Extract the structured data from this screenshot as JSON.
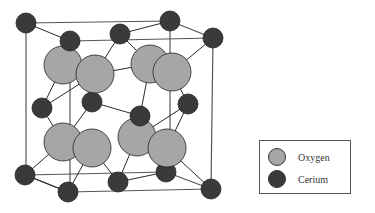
{
  "colors": {
    "oxygen": "#a6a6a6",
    "cerium": "#3a3a3a",
    "bond": "#2a2a2a",
    "frame": "#555555"
  },
  "legend": {
    "items": [
      {
        "label": "Oxygen",
        "color": "#a6a6a6"
      },
      {
        "label": "Cerium",
        "color": "#3a3a3a"
      }
    ]
  },
  "structure": {
    "cube_front": [
      [
        26,
        23
      ],
      [
        213,
        38
      ],
      [
        211,
        189
      ],
      [
        25,
        175
      ]
    ],
    "cube_edges": [
      [
        26,
        23,
        170,
        21
      ],
      [
        26,
        23,
        26,
        175
      ],
      [
        170,
        21,
        213,
        38
      ],
      [
        213,
        38,
        211,
        189
      ],
      [
        26,
        175,
        68,
        192
      ],
      [
        68,
        192,
        211,
        189
      ],
      [
        70,
        41,
        213,
        38
      ],
      [
        70,
        41,
        70,
        192
      ],
      [
        170,
        21,
        170,
        172
      ],
      [
        26,
        175,
        166,
        172
      ],
      [
        166,
        172,
        211,
        189
      ]
    ],
    "bonds": [
      [
        26,
        23,
        70,
        41
      ],
      [
        170,
        21,
        120,
        34
      ],
      [
        213,
        38,
        172,
        72
      ],
      [
        70,
        41,
        63,
        65
      ],
      [
        120,
        34,
        95,
        74
      ],
      [
        120,
        34,
        150,
        64
      ],
      [
        63,
        65,
        42,
        108
      ],
      [
        95,
        74,
        92,
        102
      ],
      [
        95,
        74,
        150,
        64
      ],
      [
        150,
        64,
        140,
        116
      ],
      [
        172,
        72,
        188,
        104
      ],
      [
        42,
        108,
        63,
        142
      ],
      [
        92,
        102,
        63,
        142
      ],
      [
        92,
        102,
        140,
        116
      ],
      [
        140,
        116,
        137,
        137
      ],
      [
        188,
        104,
        167,
        148
      ],
      [
        63,
        142,
        25,
        175
      ],
      [
        92,
        148,
        68,
        192
      ],
      [
        92,
        148,
        118,
        182
      ],
      [
        137,
        137,
        118,
        182
      ],
      [
        167,
        148,
        211,
        189
      ],
      [
        167,
        148,
        166,
        172
      ],
      [
        25,
        175,
        68,
        192
      ],
      [
        118,
        182,
        166,
        172
      ],
      [
        42,
        108,
        95,
        74
      ],
      [
        188,
        104,
        137,
        137
      ],
      [
        63,
        65,
        95,
        74
      ]
    ],
    "oxygen_atoms": [
      [
        63,
        65
      ],
      [
        95,
        74
      ],
      [
        150,
        64
      ],
      [
        172,
        72
      ],
      [
        63,
        142
      ],
      [
        92,
        148
      ],
      [
        137,
        137
      ],
      [
        167,
        148
      ]
    ],
    "cerium_back": [
      [
        170,
        21
      ],
      [
        120,
        34
      ],
      [
        92,
        102
      ],
      [
        188,
        104
      ],
      [
        166,
        172
      ],
      [
        118,
        182
      ]
    ],
    "cerium_front": [
      [
        26,
        23
      ],
      [
        213,
        38
      ],
      [
        70,
        41
      ],
      [
        42,
        108
      ],
      [
        140,
        116
      ],
      [
        25,
        175
      ],
      [
        68,
        192
      ],
      [
        211,
        189
      ]
    ]
  }
}
